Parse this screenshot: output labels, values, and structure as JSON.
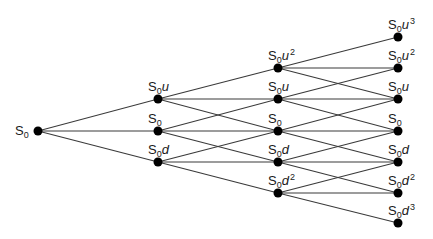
{
  "diagram": {
    "colors": {
      "edge": "#3a3a3a",
      "node": "#000000",
      "text": "#1a1a1a"
    },
    "node_radius": 4.5,
    "nodes": [
      {
        "id": "r",
        "x": 38,
        "y": 131,
        "label": {
          "base": "S",
          "sub": "0",
          "var": "",
          "sup": ""
        },
        "label_pos": "left"
      },
      {
        "id": "1u",
        "x": 158,
        "y": 99,
        "label": {
          "base": "S",
          "sub": "0",
          "var": "u",
          "sup": ""
        },
        "label_pos": "above"
      },
      {
        "id": "1m",
        "x": 158,
        "y": 131,
        "label": {
          "base": "S",
          "sub": "0",
          "var": "",
          "sup": ""
        },
        "label_pos": "above"
      },
      {
        "id": "1d",
        "x": 158,
        "y": 162,
        "label": {
          "base": "S",
          "sub": "0",
          "var": "d",
          "sup": ""
        },
        "label_pos": "above"
      },
      {
        "id": "2uu",
        "x": 278,
        "y": 68,
        "label": {
          "base": "S",
          "sub": "0",
          "var": "u",
          "sup": "2"
        },
        "label_pos": "above"
      },
      {
        "id": "2u",
        "x": 278,
        "y": 99,
        "label": {
          "base": "S",
          "sub": "0",
          "var": "u",
          "sup": ""
        },
        "label_pos": "above"
      },
      {
        "id": "2m",
        "x": 278,
        "y": 131,
        "label": {
          "base": "S",
          "sub": "0",
          "var": "",
          "sup": ""
        },
        "label_pos": "above"
      },
      {
        "id": "2d",
        "x": 278,
        "y": 162,
        "label": {
          "base": "S",
          "sub": "0",
          "var": "d",
          "sup": ""
        },
        "label_pos": "above"
      },
      {
        "id": "2dd",
        "x": 278,
        "y": 193,
        "label": {
          "base": "S",
          "sub": "0",
          "var": "d",
          "sup": "2"
        },
        "label_pos": "above"
      },
      {
        "id": "3u3",
        "x": 398,
        "y": 37,
        "label": {
          "base": "S",
          "sub": "0",
          "var": "u",
          "sup": "3"
        },
        "label_pos": "above"
      },
      {
        "id": "3u2",
        "x": 398,
        "y": 68,
        "label": {
          "base": "S",
          "sub": "0",
          "var": "u",
          "sup": "2"
        },
        "label_pos": "above"
      },
      {
        "id": "3u",
        "x": 398,
        "y": 99,
        "label": {
          "base": "S",
          "sub": "0",
          "var": "u",
          "sup": ""
        },
        "label_pos": "above"
      },
      {
        "id": "3m",
        "x": 398,
        "y": 131,
        "label": {
          "base": "S",
          "sub": "0",
          "var": "",
          "sup": ""
        },
        "label_pos": "above"
      },
      {
        "id": "3d",
        "x": 398,
        "y": 162,
        "label": {
          "base": "S",
          "sub": "0",
          "var": "d",
          "sup": ""
        },
        "label_pos": "above"
      },
      {
        "id": "3d2",
        "x": 398,
        "y": 193,
        "label": {
          "base": "S",
          "sub": "0",
          "var": "d",
          "sup": "2"
        },
        "label_pos": "above"
      },
      {
        "id": "3d3",
        "x": 398,
        "y": 223,
        "label": {
          "base": "S",
          "sub": "0",
          "var": "d",
          "sup": "3"
        },
        "label_pos": "above"
      }
    ],
    "edges": [
      [
        "r",
        "1u"
      ],
      [
        "r",
        "1m"
      ],
      [
        "r",
        "1d"
      ],
      [
        "1u",
        "2uu"
      ],
      [
        "1u",
        "2u"
      ],
      [
        "1u",
        "2m"
      ],
      [
        "1m",
        "2u"
      ],
      [
        "1m",
        "2m"
      ],
      [
        "1m",
        "2d"
      ],
      [
        "1d",
        "2m"
      ],
      [
        "1d",
        "2d"
      ],
      [
        "1d",
        "2dd"
      ],
      [
        "2uu",
        "3u3"
      ],
      [
        "2uu",
        "3u2"
      ],
      [
        "2uu",
        "3u"
      ],
      [
        "2u",
        "3u2"
      ],
      [
        "2u",
        "3u"
      ],
      [
        "2u",
        "3m"
      ],
      [
        "2m",
        "3u"
      ],
      [
        "2m",
        "3m"
      ],
      [
        "2m",
        "3d"
      ],
      [
        "2d",
        "3m"
      ],
      [
        "2d",
        "3d"
      ],
      [
        "2d",
        "3d2"
      ],
      [
        "2dd",
        "3d"
      ],
      [
        "2dd",
        "3d2"
      ],
      [
        "2dd",
        "3d3"
      ]
    ]
  }
}
